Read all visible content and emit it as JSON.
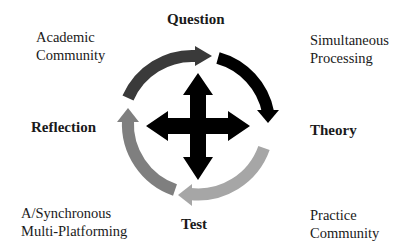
{
  "diagram": {
    "stages": {
      "top": "Question",
      "right": "Theory",
      "bottom": "Test",
      "left": "Reflection"
    },
    "corners": {
      "top_left": [
        "Academic",
        "Community"
      ],
      "top_right": [
        "Simultaneous",
        "Processing"
      ],
      "bottom_left": [
        "A/Synchronous",
        "Multi-Platforming"
      ],
      "bottom_right": [
        "Practice",
        "Community"
      ]
    },
    "cycle_arrows": [
      {
        "segment": "reflection-to-question",
        "color": "#3a3a3a"
      },
      {
        "segment": "question-to-theory",
        "color": "#000000"
      },
      {
        "segment": "theory-to-test",
        "color": "#a6a6a6"
      },
      {
        "segment": "test-to-reflection",
        "color": "#7f7f7f"
      }
    ],
    "center_icon": "four-way-arrow",
    "center_color": "#000000"
  }
}
